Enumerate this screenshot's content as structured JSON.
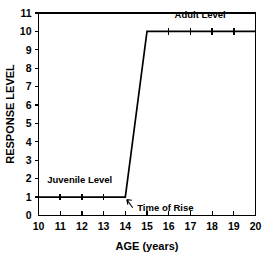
{
  "chart_data": {
    "type": "line",
    "title": "",
    "xlabel": "AGE (years)",
    "ylabel": "RESPONSE LEVEL",
    "xlim": [
      10,
      20
    ],
    "ylim": [
      0,
      11
    ],
    "grid": false,
    "legend_position": "none",
    "x_ticks": [
      10,
      11,
      12,
      13,
      14,
      15,
      16,
      17,
      18,
      19,
      20
    ],
    "x_tick_labels": [
      "10",
      "11",
      "12",
      "13",
      "14",
      "15",
      "16",
      "17",
      "18",
      "19",
      "20"
    ],
    "y_ticks": [
      0,
      1,
      2,
      3,
      4,
      5,
      6,
      7,
      8,
      9,
      10,
      11
    ],
    "y_tick_labels": [
      "0",
      "1",
      "2",
      "3",
      "4",
      "5",
      "6",
      "7",
      "8",
      "9",
      "10",
      "11"
    ],
    "series": [
      {
        "name": "Response level",
        "x": [
          10,
          14,
          15,
          20
        ],
        "values": [
          1,
          1,
          10,
          10
        ],
        "marker_points": [
          {
            "x": 11,
            "y": 1
          },
          {
            "x": 12,
            "y": 1
          },
          {
            "x": 13,
            "y": 1
          },
          {
            "x": 16,
            "y": 10
          },
          {
            "x": 17,
            "y": 10
          },
          {
            "x": 18,
            "y": 10
          },
          {
            "x": 19,
            "y": 10
          }
        ]
      }
    ],
    "annotations": [
      {
        "name": "juvenile-level",
        "text": "Juvenile Level",
        "x": 11.9,
        "y": 1.75
      },
      {
        "name": "adult-level",
        "text": "Adult Level",
        "x": 17.45,
        "y": 10.75
      },
      {
        "name": "time-of-rise",
        "text": "Time of Rise",
        "x": 14.55,
        "y": 0.45,
        "arrow_to": {
          "x": 14.0,
          "y": 1.0
        }
      }
    ],
    "colors": {
      "line": "#000000",
      "axis": "#000000",
      "text": "#000000",
      "background": "#ffffff"
    }
  }
}
